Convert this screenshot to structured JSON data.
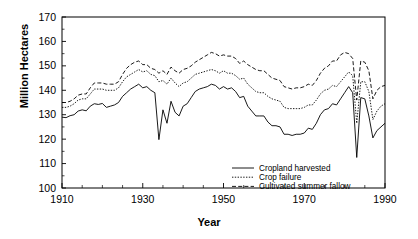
{
  "chart_data": {
    "type": "line",
    "title": "",
    "xlabel": "Year",
    "ylabel": "Million Hectares",
    "xlim": [
      1910,
      1990
    ],
    "ylim": [
      100,
      170
    ],
    "xticks": [
      1910,
      1930,
      1950,
      1970,
      1990
    ],
    "yticks": [
      100,
      110,
      120,
      130,
      140,
      150,
      160,
      170
    ],
    "minor_tick_step_x": 5,
    "grid": false,
    "legend_position": "bottom-right",
    "x": [
      1910,
      1911,
      1912,
      1913,
      1914,
      1915,
      1916,
      1917,
      1918,
      1919,
      1920,
      1921,
      1922,
      1923,
      1924,
      1925,
      1926,
      1927,
      1928,
      1929,
      1930,
      1931,
      1932,
      1933,
      1934,
      1935,
      1936,
      1937,
      1938,
      1939,
      1940,
      1941,
      1942,
      1943,
      1944,
      1945,
      1946,
      1947,
      1948,
      1949,
      1950,
      1951,
      1952,
      1953,
      1954,
      1955,
      1956,
      1957,
      1958,
      1959,
      1960,
      1961,
      1962,
      1963,
      1964,
      1965,
      1966,
      1967,
      1968,
      1969,
      1970,
      1971,
      1972,
      1973,
      1974,
      1975,
      1976,
      1977,
      1978,
      1979,
      1980,
      1981,
      1982,
      1983,
      1984,
      1985,
      1986,
      1987,
      1988,
      1989,
      1990
    ],
    "series": [
      {
        "name": "Cropland harvested",
        "style": "solid",
        "values": [
          129.0,
          128.8,
          129.6,
          130.0,
          131.5,
          132.0,
          131.6,
          133.5,
          134.5,
          134.2,
          134.6,
          133.0,
          133.5,
          134.0,
          135.0,
          137.5,
          139.0,
          140.5,
          141.5,
          142.5,
          141.0,
          141.5,
          140.0,
          139.0,
          119.8,
          132.0,
          126.5,
          135.5,
          131.0,
          129.5,
          133.5,
          134.5,
          137.0,
          139.5,
          140.5,
          141.0,
          141.5,
          142.5,
          142.0,
          140.5,
          141.5,
          140.5,
          141.0,
          139.5,
          137.0,
          137.5,
          133.5,
          131.5,
          129.5,
          129.5,
          129.5,
          127.0,
          125.5,
          125.5,
          125.0,
          122.0,
          122.0,
          121.5,
          122.0,
          122.0,
          122.5,
          124.5,
          124.0,
          126.5,
          130.0,
          132.0,
          132.5,
          134.5,
          134.0,
          136.5,
          139.0,
          141.5,
          139.0,
          112.5,
          137.0,
          136.5,
          129.5,
          120.5,
          123.5,
          125.0,
          126.5
        ]
      },
      {
        "name": "Crop failure",
        "style": "dotted",
        "values": [
          133.0,
          133.0,
          133.5,
          134.5,
          136.0,
          136.5,
          136.5,
          138.5,
          140.5,
          140.5,
          140.5,
          140.0,
          140.0,
          140.0,
          141.0,
          143.5,
          145.5,
          146.5,
          147.5,
          148.5,
          147.5,
          148.0,
          146.5,
          146.0,
          143.5,
          144.0,
          142.5,
          145.0,
          143.0,
          141.5,
          143.0,
          143.5,
          145.0,
          146.5,
          147.0,
          147.5,
          148.0,
          148.5,
          148.0,
          147.0,
          148.0,
          147.0,
          147.0,
          146.0,
          144.5,
          145.0,
          142.5,
          141.0,
          139.5,
          139.0,
          139.0,
          137.5,
          136.5,
          136.0,
          135.5,
          133.0,
          132.5,
          132.5,
          132.5,
          132.5,
          133.0,
          134.0,
          134.0,
          136.0,
          138.5,
          140.0,
          140.5,
          142.0,
          141.5,
          143.5,
          145.5,
          147.5,
          146.0,
          126.5,
          143.5,
          143.5,
          139.5,
          128.0,
          131.5,
          133.5,
          134.5
        ]
      },
      {
        "name": "Cultivated summer fallow",
        "style": "dashed",
        "values": [
          135.0,
          135.0,
          135.5,
          136.5,
          138.0,
          138.5,
          138.5,
          141.0,
          143.0,
          143.0,
          143.0,
          142.5,
          142.5,
          142.5,
          143.5,
          146.5,
          149.0,
          150.5,
          151.5,
          152.0,
          150.5,
          150.5,
          149.0,
          148.5,
          147.0,
          148.0,
          146.5,
          149.5,
          148.0,
          147.0,
          148.5,
          149.0,
          150.0,
          151.5,
          152.5,
          153.5,
          154.5,
          155.5,
          155.0,
          154.0,
          154.5,
          154.0,
          154.0,
          153.0,
          151.0,
          152.0,
          150.5,
          149.5,
          148.5,
          148.0,
          148.0,
          146.5,
          145.0,
          144.5,
          144.0,
          141.5,
          141.0,
          140.5,
          141.0,
          141.0,
          141.5,
          142.5,
          142.0,
          144.0,
          147.0,
          149.0,
          150.0,
          152.0,
          152.0,
          154.5,
          155.5,
          155.0,
          153.0,
          136.0,
          152.0,
          151.5,
          148.0,
          136.5,
          140.0,
          141.5,
          142.0
        ]
      }
    ]
  },
  "axes": {
    "y_tick_labels": [
      "170",
      "160",
      "150",
      "140",
      "130",
      "120",
      "110",
      "100"
    ],
    "x_tick_labels": [
      "1910",
      "1930",
      "1950",
      "1970",
      "1990"
    ],
    "x_axis_title": "Year",
    "y_axis_title": "Million Hectares"
  },
  "legend": {
    "entries": [
      {
        "label": "Cropland harvested",
        "style": "solid"
      },
      {
        "label": "Crop failure",
        "style": "dotted"
      },
      {
        "label": "Cultivated summer fallow",
        "style": "dashed"
      }
    ]
  }
}
